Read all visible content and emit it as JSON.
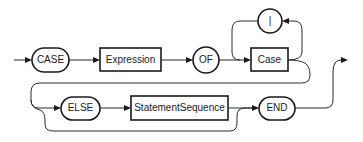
{
  "diagram": {
    "type": "syntax-diagram",
    "terminals": [
      {
        "id": "case_kw",
        "label": "CASE"
      },
      {
        "id": "of_kw",
        "label": "OF"
      },
      {
        "id": "bar",
        "label": "|"
      },
      {
        "id": "else_kw",
        "label": "ELSE"
      },
      {
        "id": "end_kw",
        "label": "END"
      }
    ],
    "nonterminals": [
      {
        "id": "expression",
        "label": "Expression"
      },
      {
        "id": "case",
        "label": "Case"
      },
      {
        "id": "statement_sequence",
        "label": "StatementSequence"
      }
    ],
    "edges": [
      [
        "start",
        "CASE"
      ],
      [
        "CASE",
        "Expression"
      ],
      [
        "Expression",
        "OF"
      ],
      [
        "OF",
        "Case"
      ],
      [
        "Case",
        "|"
      ],
      [
        "|",
        "Case"
      ],
      [
        "Case",
        "ELSE"
      ],
      [
        "Case",
        "END"
      ],
      [
        "ELSE",
        "StatementSequence"
      ],
      [
        "StatementSequence",
        "END"
      ],
      [
        "END",
        "exit"
      ]
    ]
  },
  "colors": {
    "stroke": "#1a1a1a",
    "background": "#ffffff"
  }
}
